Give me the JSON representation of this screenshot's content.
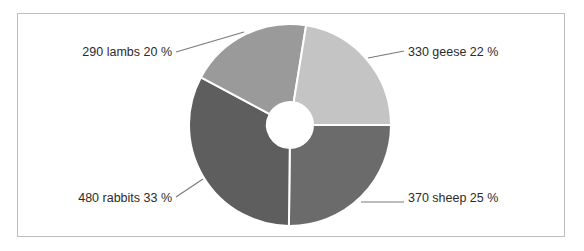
{
  "chart_data": {
    "type": "pie",
    "variant": "donut",
    "title": "",
    "start_angle_deg": 0,
    "direction": "clockwise",
    "center": [
      290,
      125
    ],
    "outer_radius": 101,
    "inner_radius": 23,
    "slices": [
      {
        "name": "sheep",
        "value": 370,
        "percent": 25,
        "label": "370 sheep 25 %",
        "color": "#6b6b6b"
      },
      {
        "name": "rabbits",
        "value": 480,
        "percent": 33,
        "label": "480 rabbits 33 %",
        "color": "#5e5e5e"
      },
      {
        "name": "lambs",
        "value": 290,
        "percent": 20,
        "label": "290 lambs 20 %",
        "color": "#9a9a9a"
      },
      {
        "name": "geese",
        "value": 330,
        "percent": 22,
        "label": "330 geese 22 %",
        "color": "#c4c4c4"
      }
    ],
    "categories": [
      "sheep",
      "rabbits",
      "lambs",
      "geese"
    ],
    "values": [
      370,
      480,
      290,
      330
    ],
    "legend": null
  },
  "labels": {
    "sheep": "370 sheep 25 %",
    "rabbits": "480 rabbits 33 %",
    "lambs": "290 lambs 20 %",
    "geese": "330 geese 22 %"
  }
}
